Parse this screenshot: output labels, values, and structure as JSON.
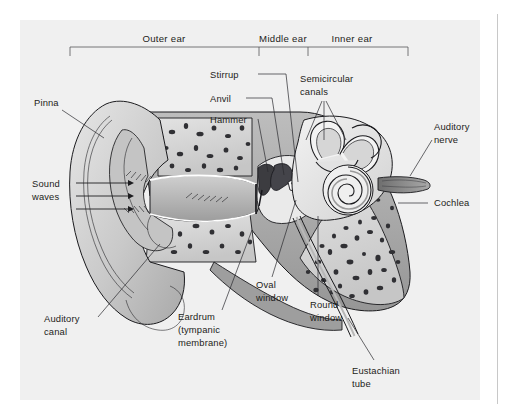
{
  "figure": {
    "panel_bg": "#f0f0f0",
    "page_bg": "#ffffff",
    "ink": "#1d1d20"
  },
  "sections": [
    {
      "id": "outer",
      "label": "Outer ear"
    },
    {
      "id": "middle",
      "label": "Middle ear"
    },
    {
      "id": "inner",
      "label": "Inner ear"
    }
  ],
  "labels": {
    "pinna": "Pinna",
    "sound_waves_line1": "Sound",
    "sound_waves_line2": "waves",
    "auditory_canal_line1": "Auditory",
    "auditory_canal_line2": "canal",
    "eardrum_line1": "Eardrum",
    "eardrum_line2": "(tympanic",
    "eardrum_line3": "membrane)",
    "stirrup": "Stirrup",
    "anvil": "Anvil",
    "hammer": "Hammer",
    "semicircular_line1": "Semicircular",
    "semicircular_line2": "canals",
    "auditory_nerve_line1": "Auditory",
    "auditory_nerve_line2": "nerve",
    "cochlea": "Cochlea",
    "oval_window_line1": "Oval",
    "oval_window_line2": "window",
    "round_window_line1": "Round",
    "round_window_line2": "window",
    "eustachian_line1": "Eustachian",
    "eustachian_line2": "tube"
  },
  "colors": {
    "bone_light": "#d9d9d9",
    "bone_mid": "#b4b4b4",
    "tissue_dark": "#8e8e8e",
    "canal_shadow": "#a2a2a2",
    "ossicle_dark": "#3c3c40",
    "white": "#ffffff",
    "outline": "#1b1b1e"
  }
}
